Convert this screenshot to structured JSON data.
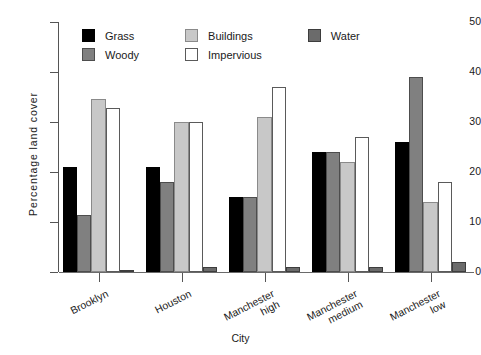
{
  "chart_data": {
    "type": "bar",
    "title": "",
    "xlabel": "City",
    "ylabel": "Percentage land cover",
    "ylim": [
      0,
      50
    ],
    "yticks": [
      0,
      10,
      20,
      30,
      40,
      50
    ],
    "grid": false,
    "legend_position": "top-inside",
    "categories": [
      "Brooklyn",
      "Houston",
      "Manchester\nhigh",
      "Manchester\nmedium",
      "Manchester\nlow"
    ],
    "series": [
      {
        "name": "Grass",
        "color": "#000000",
        "values": [
          21,
          21,
          15,
          24,
          26
        ]
      },
      {
        "name": "Woody",
        "color": "#808080",
        "values": [
          11.4,
          18,
          15,
          24,
          39
        ]
      },
      {
        "name": "Buildings",
        "color": "#c8c8c8",
        "values": [
          34.6,
          30,
          31,
          22,
          14
        ]
      },
      {
        "name": "Impervious",
        "color": "#ffffff",
        "values": [
          32.8,
          30,
          37,
          27,
          18
        ]
      },
      {
        "name": "Water",
        "color": "#6b6b6b",
        "values": [
          0.5,
          1,
          1,
          1,
          2
        ]
      }
    ]
  }
}
